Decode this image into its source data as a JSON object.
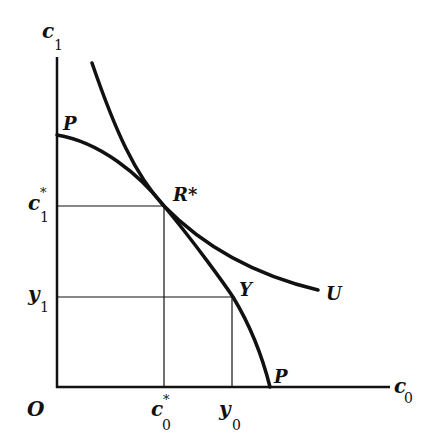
{
  "diagram": {
    "type": "economics-intertemporal-choice",
    "colors": {
      "line": "#111111",
      "background": "#ffffff"
    },
    "axes": {
      "origin_label": "O",
      "x_axis": {
        "var": "c",
        "sub": "0"
      },
      "y_axis": {
        "var": "c",
        "sub": "1"
      }
    },
    "curves": {
      "ppf": {
        "label_top": "P",
        "label_bottom": "P",
        "description": "production possibility frontier"
      },
      "indifference": {
        "label": "U",
        "description": "indifference curve"
      }
    },
    "points": {
      "tangency": {
        "label": "R*"
      },
      "endowment": {
        "label": "Y"
      }
    },
    "tick_labels": {
      "y": [
        {
          "var": "c",
          "sup": "*",
          "sub": "1"
        },
        {
          "var": "y",
          "sub": "1"
        }
      ],
      "x": [
        {
          "var": "c",
          "sup": "*",
          "sub": "0"
        },
        {
          "var": "y",
          "sub": "0"
        }
      ]
    }
  }
}
